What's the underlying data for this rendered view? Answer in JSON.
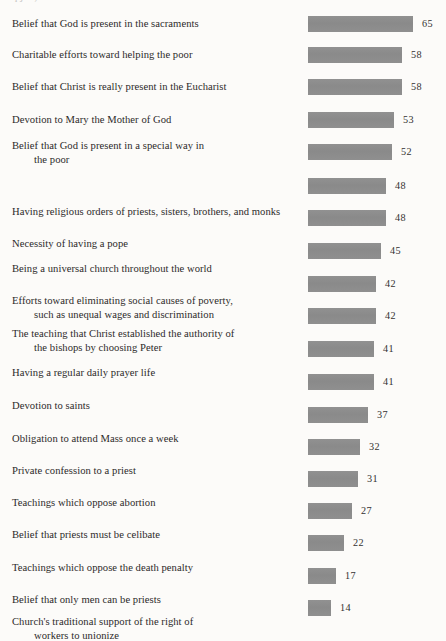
{
  "page": {
    "background_color": "#fcfbf9",
    "text_color": "#2c2a29",
    "clipped_top_line": "q                 j  o                                  ,                            33"
  },
  "chart_data": {
    "type": "bar",
    "orientation": "horizontal",
    "title": "",
    "subtitle": "",
    "xlabel": "",
    "ylabel": "",
    "xlim": [
      0,
      65
    ],
    "grid": false,
    "legend": null,
    "bar_color": "#8d8d8d",
    "value_label_position": "outside-end",
    "categories": [
      "Belief that God is present in the sacraments",
      "Charitable efforts toward helping the poor",
      "Belief that Christ is really present in the Eucharist",
      "Devotion to Mary the Mother of God",
      "Belief that God is present in a special way in the poor",
      "Having religious orders of priests, sisters, brothers, and monks",
      "Necessity of having a pope",
      "Being a universal church throughout the world",
      "Efforts toward eliminating social causes of poverty, such as unequal wages and discrimination",
      "The teaching that Christ established the authority of the bishops by choosing Peter",
      "Having a regular daily prayer life",
      "Devotion to saints",
      "Obligation to attend Mass once a week",
      "Private confession to a priest",
      "Teachings which oppose abortion",
      "Belief that priests must be celibate",
      "Teachings which oppose the death penalty",
      "Belief that only men can be priests",
      "Church's traditional support of the right of workers to unionize"
    ],
    "values": [
      65,
      58,
      58,
      53,
      52,
      48,
      48,
      45,
      42,
      42,
      41,
      41,
      37,
      32,
      31,
      27,
      22,
      17,
      14
    ]
  },
  "rows": [
    {
      "label_line1": "Belief that God is present in the sacraments",
      "label_line2": "",
      "value": 65,
      "value_text": "65",
      "label_top": 17,
      "bar_top": 16
    },
    {
      "label_line1": "Charitable efforts toward helping the poor",
      "label_line2": "",
      "value": 58,
      "value_text": "58",
      "label_top": 48,
      "bar_top": 47
    },
    {
      "label_line1": "Belief that Christ is really present in the Eucharist",
      "label_line2": "",
      "value": 58,
      "value_text": "58",
      "label_top": 80,
      "bar_top": 79
    },
    {
      "label_line1": "Devotion to Mary the Mother of God",
      "label_line2": "",
      "value": 53,
      "value_text": "53",
      "label_top": 113,
      "bar_top": 112
    },
    {
      "label_line1": "Belief that God is present in a special way in",
      "label_line2": "the poor",
      "value": 52,
      "value_text": "52",
      "label_top": 139,
      "bar_top": 144
    },
    {
      "label_line1": "Having religious orders of priests, sisters, brothers, and monks",
      "label_line2": "",
      "value": 48,
      "value_text": "48",
      "label_top": 205,
      "bar_top": 178
    },
    {
      "label_line1": "Necessity of having a pope",
      "label_line2": "",
      "value": 48,
      "value_text": "48",
      "label_top": 237,
      "bar_top": 210
    },
    {
      "label_line1": "Being a universal church throughout the world",
      "label_line2": "",
      "value": 45,
      "value_text": "45",
      "label_top": 262,
      "bar_top": 243
    },
    {
      "label_line1": "Efforts toward eliminating social causes of poverty,",
      "label_line2": "such as unequal wages and discrimination",
      "value": 42,
      "value_text": "42",
      "label_top": 294,
      "bar_top": 276
    },
    {
      "label_line1": "The teaching that Christ established the authority of",
      "label_line2": "the bishops by choosing Peter",
      "value": 42,
      "value_text": "42",
      "label_top": 327,
      "bar_top": 308
    },
    {
      "label_line1": "Having a regular daily prayer life",
      "label_line2": "",
      "value": 41,
      "value_text": "41",
      "label_top": 366,
      "bar_top": 341
    },
    {
      "label_line1": "Devotion to saints",
      "label_line2": "",
      "value": 41,
      "value_text": "41",
      "label_top": 399,
      "bar_top": 374
    },
    {
      "label_line1": "Obligation to attend Mass once a week",
      "label_line2": "",
      "value": 37,
      "value_text": "37",
      "label_top": 432,
      "bar_top": 407
    },
    {
      "label_line1": "Private confession to a priest",
      "label_line2": "",
      "value": 32,
      "value_text": "32",
      "label_top": 464,
      "bar_top": 439
    },
    {
      "label_line1": "Teachings which oppose abortion",
      "label_line2": "",
      "value": 31,
      "value_text": "31",
      "label_top": 496,
      "bar_top": 471
    },
    {
      "label_line1": "Belief that priests must be celibate",
      "label_line2": "",
      "value": 27,
      "value_text": "27",
      "label_top": 528,
      "bar_top": 503
    },
    {
      "label_line1": "Teachings which oppose the death penalty",
      "label_line2": "",
      "value": 22,
      "value_text": "22",
      "label_top": 561,
      "bar_top": 535
    },
    {
      "label_line1": "Belief that only men can be priests",
      "label_line2": "",
      "value": 17,
      "value_text": "17",
      "label_top": 593,
      "bar_top": 568
    },
    {
      "label_line1": "Church's traditional support of the right of",
      "label_line2": "workers to unionize",
      "value": 14,
      "value_text": "14",
      "label_top": 615,
      "bar_top": 600
    }
  ]
}
